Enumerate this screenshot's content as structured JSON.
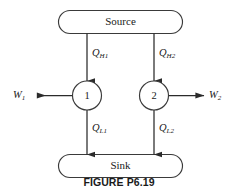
{
  "figure": {
    "caption": "FIGURE P6.19",
    "stroke_color": "#3a3a3a",
    "arrow_color": "#2b2b2b",
    "background": "#ffffff"
  },
  "reservoirs": [
    {
      "name": "source",
      "label": "Source"
    },
    {
      "name": "sink",
      "label": "Sink"
    }
  ],
  "engines": [
    {
      "name": "engine-1",
      "label": "1"
    },
    {
      "name": "engine-2",
      "label": "2"
    }
  ],
  "flows": [
    {
      "name": "heat-in-1",
      "symbol": "Q",
      "subscript": "H1",
      "direction": "down"
    },
    {
      "name": "heat-in-2",
      "symbol": "Q",
      "subscript": "H2",
      "direction": "down"
    },
    {
      "name": "heat-out-1",
      "symbol": "Q",
      "subscript": "L1",
      "direction": "down"
    },
    {
      "name": "heat-out-2",
      "symbol": "Q",
      "subscript": "L2",
      "direction": "down"
    },
    {
      "name": "work-out-1",
      "symbol": "W",
      "subscript": "1",
      "direction": "left"
    },
    {
      "name": "work-out-2",
      "symbol": "W",
      "subscript": "2",
      "direction": "right"
    }
  ]
}
